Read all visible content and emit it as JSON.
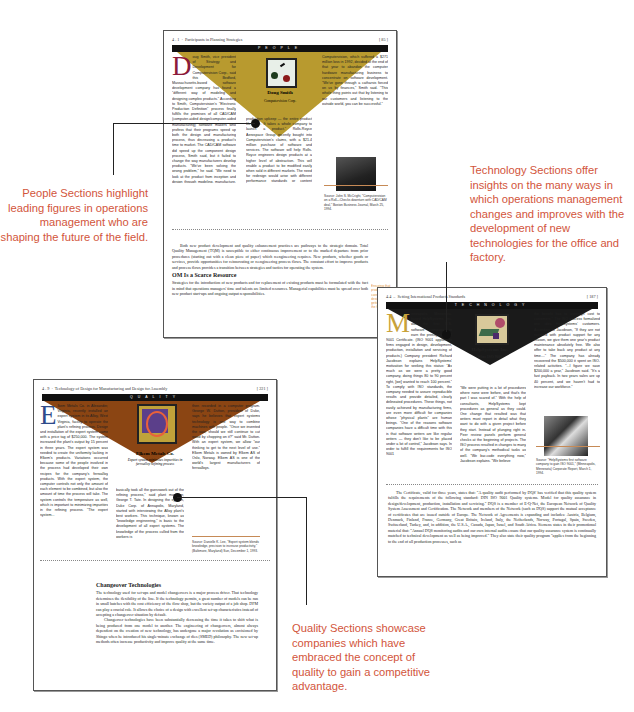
{
  "people_page": {
    "section": "4 . 1",
    "running_head": "Participants in Planning Strategies",
    "page_number": "[ 85 ]",
    "banner": "PEOPLE",
    "featured_name": "Doug Smith",
    "featured_company": "Computervision Corp.",
    "triangle_color": "#b89a2f",
    "col1": "oug Smith, vice president of Strategy and Development for Computervision Corp., said this Bedford, Massachusetts-based software development company has found a \"different way of modeling and designing complex products.\" According to Smith, Computervision's \"Electronic Production Definition\" process finally fulfills the promises of all CAD/CAM (computer-aided design/computer-aided manufacturing) software makers who profess that their programs speed up both the design and manufacturing process, thus decreasing a product's time to market. The CAD/CAM software did speed up the component design process, Smith said, but it failed to change the way manufacturers develop products. \"We've been solving the wrong problem,\" he said. \"We need to look at the product from inception and design through modeling, manufacture, distribution, and post-",
    "col2": "production upkeep — the entire product life cycle. It takes a whole company to launch a product.\" Rolls-Royce Aerospace Group recently bought into Computervision's claims, with a $21.4 million purchase of software and services. The software will help Rolls-Royce engineers design products at a higher level of abstraction. This will enable a product to be modified easily when sold in different markets. The need for redesign would arise with different performance standards or content requirements.",
    "col3": "Computervision, which suffered a $271 million loss in 1992, decided at the end of that year to abandon the computer hardware manufacturing business to concentrate on software development. \"We've gone through a catharsis forced on us by finances,\" Smith said. \"This whole thing points out that by listening to our customers and listening to the outside world, you can be successful.\"",
    "source": "Source: John S. McCright, \"Computervision on a Roll—Checks downturn with CAD/CAM deal,\" Boston Business Journal, March 25, 1994.",
    "body_para": "Both new product development and quality enhancement practices are pathways to the strategic domain. Total Quality Management (TQM) is susceptible to either continuous improvement or to the marked departure from prior procedures (starting out with a clean piece of paper) which reengineering requires. New products, whether goods or services, provide opportunities for reinnovating or reengineering process flows. The constant effort to improve products and process flows provides a transition between strategies and tactics for operating the system.",
    "heading": "OM Is a Scarce Resource",
    "body_para2": "Strategies for the introduction of new products and for replacement of existing products must be formulated with the fact in mind that operations managers' time and talents are limited resources. Managerial capabilities must be spread over both new product start-ups and ongoing output responsibilities.",
    "margin_note": "Ensuring that products are taken care of through design stages for getting things right the first time"
  },
  "technology_page": {
    "section": "4.4",
    "running_head": "Setting International Products Standards",
    "page_number": "[ 187 ]",
    "banner": "TECHNOLOGY",
    "featured_name": "HelpSystems Inc.",
    "featured_company": "Wins ISO 9001",
    "triangle_color": "#1a1a1a",
    "col1": "inneapolis, Minnesota-based HelpSystems, Inc. was the first U.S. software company to earn the prestigious ISO 9001 Certificate. (ISO 9001 applies to firms engaged in design, development, production, installation and servicing of products.) Company president Richard Jacobson explains HelpSystems' motivation for seeking this status: \"As much as we were a pretty good company, doing things 80 to 90 percent right, [we] wanted to reach 100 percent.\" To comply with ISO standards, the company needed to assure reproducible results and provide detailed, clearly delineated procedures. These things, not easily achieved by manufacturing firms, are even more difficult for companies whose \"physical plants\" are human beings. \"One of the reasons software companies have a difficult time with this is that software writers are like regular writers — they don't like to be placed under a lot of control,\" Jacobson says. In order to fulfill the requirements for ISO 9001",
    "col2": "\"We were putting in a lot of procedures where none were before, and that's the part I was scared of.\" With the help of consultants, HelpSystems kept procedures as general as they could. One change that resulted was that writers must report in detail what they want to do with a given project before they start. Instead of plunging right in. Peer review panels perform general checks at the beginning of projects. The ISO process resulted in changes to many of the company's methodical tasks as well. \"We bar-code everything now,\" Jacobson explains. \"We believe",
    "col3": "the benefit has to outweigh cost to customers.\" The ISO process formalized one idea HelpSystems' customers. According to Jacobson, \"If they are not satisfied with product support for any reason, we give them one year's product maintenance absolutely free. We also offer to take back any product at any time....\" The company has already recovered the $500,000 it spent on ISO-related activities. \"...I figure we save $200,000 a year,\" Jacobson said. \"It's a fast payback. In two years sales are up 40 percent, and we haven't had to increase our workforce.\"",
    "source": "Source: \"HelpSystems first software company to gain ISO 9001,\" (Minneapolis, Minnesota) Corporate Report, March 1, 1994.",
    "body_para": "The Certificate, valid for three years, states that: \"A quality audit performed by DQS' has verified that this quality system fulfills the requirements of the following standard: DIN ISO 9001 Quality systems. Model for quality assurance in design/development, production, installation and servicing.\" DQS is a member of E-Q-Net, the European Network of Quality System Assessment and Certification. The Network and members of the Network (such as DQS) support the mutual acceptance of certificates that are issued outside of Europe. The Network of Agreements is expanding and includes: Austria, Belgium, Denmark, Finland, France, Germany, Great Britain, Ireland, Italy, the Netherlands, Norway, Portugal, Spain, Sweden, Switzerland, Turkey, and, in addition, the U.S.A., Canada, Japan, Israel, and South Africa. Siemens states in their promotional material that: \"Annual DQS monitoring audits and our own internal audits ensure that our quality assurance system is continually matched to technical development as well as being improved.\" They also state their quality program \"applies from the beginning to the end of all production processes, such as"
  },
  "quality_page": {
    "section": "4 . 9",
    "running_head": "Technology of Design for Manufacturing and Design for Assembly",
    "page_number": "[ 221 ]",
    "banner": "QUALITY",
    "featured_name": "Elkem Metals Co.",
    "featured_company": "Expert system minimizes impurities in ferroalloy refining process",
    "triangle_color": "#8b4513",
    "col1": "lkem Metals Co. in Alexander, Virginia, recently installed an expert system in its Alloy, West Virginia, facility to operate the plant's refining process. Design and installation of the expert system came with a price tag of $250,000. The system increased the plant's output by 15 percent in three years. The expert system was needed to create the uniformity lacking in Elkem's products. Variations occurred because some of the people involved in the process had developed their own recipes for the company's ferroalloy products. With the expert system, the computer controls not only the amount of each element to be combined, but also the amount of time the process will take. The system controls the temperature as well, which is important to minimizing impurities in the refining process. \"The expert system...",
    "col2": "basically took all the guesswork out of the refining process,\" said plant manager, George T. Tate. In designing the system, Duke Corp. of Annapolis, Maryland, started with interviewing the Alloy plant's best workers. This technique, known as \"knowledge engineering,\" is basic to the development of all expert systems. The knowledge of the process culled from the workers is",
    "col3": "then recorded in a computer program. George W. Dutton, president of Duke, says he believes that expert systems technology is one way to combine machines with people. \"Once we invented the saw, should we still continue to cut wood by chopping on it?\" said Mr. Dutton. With an expert system, we allow \"our thinking to get to the next level of use.\" Elkem Metals is owned by Elkem AS of Oslo, Norway. Elkem AS is one of the world's largest manufacturers of ferroalloys.",
    "source": "Source: Danielle K. Lee, \"Expert system blends knowledge, precision to increase productivity,\" (Baltimore, Maryland) Sun, December 1, 1993.",
    "heading": "Changeover Technologies",
    "body_para": "The technology used for set-ups and model changeovers is a major process driver. That technology determines the flexibility of the line. If the technology permits, a great number of models can be run in small batches with the cost efficiency of the flow shop, but the variety output of a job shop. DFM can play a crucial role. It allows the choice of a design with excellent set-up characteristics instead of accepting a changeover situation by default.",
    "body_para2": "Changeover technologies have been substantially decreasing the time it takes to shift what is being produced from one model to another. The engineering of changeovers, almost always dependent on the creation of new technology, has undergone a major revolution as envisioned by Shingo when he introduced his single-minute exchange of dies (SMED) philosophy. The new set-up methods often increase productivity and improve quality at the same time."
  },
  "callouts": {
    "people": "People Sections highlight leading figures in operations management who are shaping the future of the field.",
    "technology": "Technology Sections offer insights on the many ways in which operations management changes and improves with the development of new technologies for the office and factory.",
    "quality": "Quality Sections showcase companies which have embraced the concept of quality to gain a competitive advantage."
  },
  "colors": {
    "callout_text": "#d2553b",
    "people_gold": "#b89a2f",
    "quality_brown": "#8b4513",
    "caption_rule": "#c68a56"
  }
}
